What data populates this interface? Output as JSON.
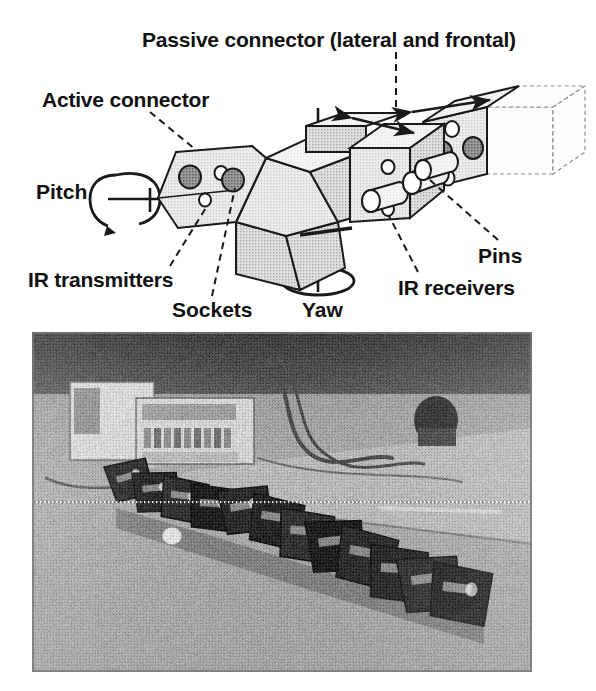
{
  "figure": {
    "type": "technical-diagram-with-photograph",
    "background_color": "#ffffff",
    "ink_color": "#1a1a1a"
  },
  "diagram": {
    "labels": {
      "passive_connector": "Passive connector (lateral and frontal)",
      "active_connector": "Active connector",
      "pitch": "Pitch",
      "ir_transmitters": "IR transmitters",
      "sockets": "Sockets",
      "yaw": "Yaw",
      "pins": "Pins",
      "ir_receivers": "IR receivers"
    },
    "parts": {
      "module_body": "faceted-module-body",
      "active_face": "active-connector-face",
      "passive_cube": "passive-connector-cube",
      "detached_cube": "detached-passive-cube",
      "pitch_axis": "pitch-rotation-axis",
      "yaw_axis": "yaw-rotation-axis"
    },
    "features": {
      "socket_count_active_face": 2,
      "ir_transmitter_count": 2,
      "ir_receiver_count": 2,
      "pin_count": 3,
      "detached_cube_sockets": 2,
      "detached_cube_receivers": 2
    },
    "colors": {
      "module_fill_light": "#e8e8e8",
      "module_fill_mid": "#dcdcdc",
      "module_fill_dark": "#cfcfcf",
      "feature_dark": "#5a5a5a",
      "outline": "#1a1a1a"
    },
    "arrows": {
      "lateral_double_arrow": "double-headed-arrow-top-face",
      "frontal_double_arrow": "double-headed-arrow-front-face",
      "pitch_rotation": "circular-arrow-counterclockwise",
      "yaw_rotation": "circular-arrow-counterclockwise"
    }
  },
  "photograph": {
    "caption": "",
    "scene": "Laboratory floor with snake-like modular robot chain, instrument rack in background",
    "frame": {
      "x": 32,
      "y": 332,
      "width": 500,
      "height": 340
    },
    "tone": "grayscale-halftone",
    "elements": [
      "equipment-rack",
      "power-supply-box",
      "cables",
      "floor",
      "robot-chain",
      "wall-panel"
    ]
  }
}
